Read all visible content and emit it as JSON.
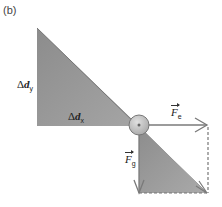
{
  "panel_label": "(b)",
  "labels": {
    "dy": {
      "symbol": "Δ",
      "var": "d",
      "sub": "y"
    },
    "dx": {
      "symbol": "Δ",
      "var": "d",
      "sub": "x"
    },
    "fe": {
      "var": "F",
      "sub": "e"
    },
    "fg": {
      "var": "F",
      "sub": "g"
    }
  },
  "colors": {
    "triangle_fill_top": "#8a8a8a",
    "triangle_fill_bottom": "#a8a8a8",
    "line": "#7a7a7a",
    "circle_fill": "#c8c8c8",
    "dashed": "#777777"
  }
}
